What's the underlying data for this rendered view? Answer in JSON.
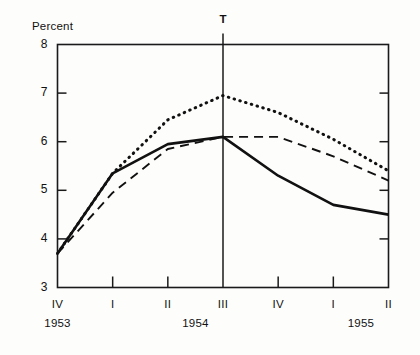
{
  "chart_data": {
    "type": "line",
    "title": "",
    "xlabel": "",
    "ylabel": "Percent",
    "ylim": [
      3,
      8
    ],
    "yticks": [
      8,
      7,
      6,
      5,
      4,
      3
    ],
    "grid": false,
    "legend": "none",
    "categories": [
      "IV",
      "I",
      "II",
      "III",
      "IV",
      "I",
      "II"
    ],
    "year_groups": [
      {
        "label": "1953",
        "quarters": [
          "IV"
        ]
      },
      {
        "label": "1954",
        "quarters": [
          "I",
          "II",
          "III",
          "IV"
        ]
      },
      {
        "label": "1955",
        "quarters": [
          "I",
          "II"
        ]
      }
    ],
    "annotations": [
      {
        "name": "T",
        "label": "T",
        "at_category": "III",
        "type": "vertical-reference-line"
      }
    ],
    "series": [
      {
        "name": "solid",
        "style": "solid",
        "values": [
          3.7,
          5.35,
          5.95,
          6.1,
          5.3,
          4.7,
          4.5
        ]
      },
      {
        "name": "dashed",
        "style": "dashed",
        "values": [
          3.7,
          4.95,
          5.85,
          6.1,
          6.1,
          5.7,
          5.2
        ]
      },
      {
        "name": "dotted",
        "style": "dotted",
        "values": [
          3.7,
          5.35,
          6.45,
          6.95,
          6.6,
          6.05,
          5.4
        ]
      }
    ]
  },
  "axes": {
    "y_title": "Percent",
    "y_tick_labels": [
      "8",
      "7",
      "6",
      "5",
      "4",
      "3"
    ],
    "x_tick_labels": [
      "IV",
      "I",
      "II",
      "III",
      "IV",
      "I",
      "II"
    ],
    "year_labels": [
      "1953",
      "1954",
      "1955"
    ]
  },
  "marker": {
    "label": "T"
  },
  "colors": {
    "ink": "#111111",
    "background": "#fdfdfc",
    "frame": "#1a1a1a"
  }
}
